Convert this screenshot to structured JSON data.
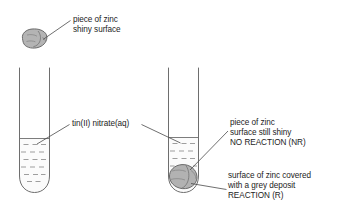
{
  "figure": {
    "type": "scientific-diagram",
    "background_color": "#ffffff",
    "ink_color": "#1c1c1c",
    "outline_color": "#6e6e6e",
    "metal_fill_color": "#b4b4b4",
    "liquid_dash_color": "#8c8c8c"
  },
  "labels": {
    "zinc_top": {
      "name": "piece-of-zinc-shiny",
      "lines": [
        "piece of zinc",
        "shiny surface"
      ]
    },
    "solution": {
      "name": "tin-nitrate-solution",
      "lines": [
        "tin(II) nitrate(aq)"
      ]
    },
    "no_reaction": {
      "name": "no-reaction-note",
      "lines": [
        "piece of zinc",
        "surface still shiny",
        "NO REACTION (NR)"
      ]
    },
    "reaction": {
      "name": "reaction-note",
      "lines": [
        "surface of zinc covered",
        "with a grey deposit",
        "REACTION (R)"
      ]
    }
  },
  "objects": {
    "zinc_sample_top": {
      "name": "zinc-piece-top-left",
      "description": "irregular shiny zinc lump drawn above the test tubes"
    },
    "test_tube_left": {
      "name": "test-tube-left",
      "description": "test tube containing tin(II) nitrate solution only"
    },
    "test_tube_right": {
      "name": "test-tube-right",
      "description": "test tube containing tin(II) nitrate solution with a zinc piece resting at the bottom"
    },
    "zinc_in_tube": {
      "name": "zinc-piece-in-tube",
      "description": "zinc lump at the base of the right test tube covered with a grey deposit"
    }
  }
}
